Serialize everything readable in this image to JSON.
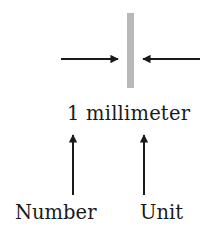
{
  "diagram": {
    "measurement_label": "1 millimeter",
    "number_label": "Number",
    "unit_label": "Unit",
    "colors": {
      "bar": "#b8b8b8",
      "arrow": "#1a1a1a",
      "text": "#1a1a1a"
    },
    "icons": {
      "left_arrow": "arrow-right-pointing",
      "right_arrow": "arrow-left-pointing",
      "number_pointer": "arrow-up",
      "unit_pointer": "arrow-up"
    }
  }
}
